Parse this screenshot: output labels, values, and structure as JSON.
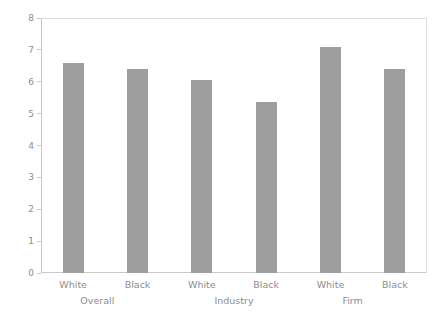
{
  "chart_data": {
    "type": "bar",
    "title": "",
    "subtitle": "",
    "xlabel": "",
    "ylabel": "",
    "ylim": [
      0,
      8
    ],
    "yticks": [
      0,
      1,
      2,
      3,
      4,
      5,
      6,
      7,
      8
    ],
    "ytick_labels": [
      "0",
      "1",
      "2",
      "3",
      "4",
      "5",
      "6",
      "7",
      "8"
    ],
    "grid": false,
    "legend": null,
    "bar_color": "#9e9e9e",
    "axis_color": "#c9c9c9",
    "frame_color": "#dedede",
    "text_color": "#8d8d8d",
    "categories": [
      "White",
      "Black",
      "White",
      "Black",
      "White",
      "Black"
    ],
    "values": [
      6.6,
      6.4,
      6.05,
      5.35,
      7.1,
      6.4
    ],
    "groups": [
      {
        "label": "Overall",
        "categories": [
          "White",
          "Black"
        ],
        "values": [
          6.6,
          6.4
        ]
      },
      {
        "label": "Industry",
        "categories": [
          "White",
          "Black"
        ],
        "values": [
          6.05,
          5.35
        ]
      },
      {
        "label": "Firm",
        "categories": [
          "White",
          "Black"
        ],
        "values": [
          7.1,
          6.4
        ]
      }
    ],
    "group_labels": [
      "Overall",
      "Industry",
      "Firm"
    ],
    "series": [
      {
        "name": "value",
        "values": [
          6.6,
          6.4,
          6.05,
          5.35,
          7.1,
          6.4
        ]
      }
    ]
  }
}
